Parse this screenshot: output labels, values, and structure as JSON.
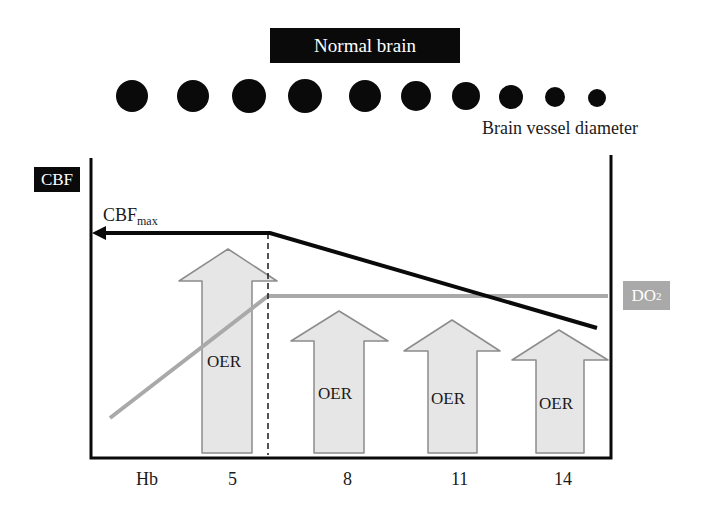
{
  "title": "Normal brain",
  "vessel_label": "Brain vessel diameter",
  "y_axis_label": "CBF",
  "cbfmax_label": {
    "main": "CBF",
    "sub": "max"
  },
  "do2_label": {
    "main": "DO",
    "sub": "2"
  },
  "oer_label": "OER",
  "x_axis": {
    "label": "Hb",
    "ticks": [
      "5",
      "8",
      "11",
      "14"
    ]
  },
  "colors": {
    "black": "#0a0a0a",
    "do2_gray": "#a9a9a9",
    "arrow_fill": "#e6e6e6",
    "arrow_stroke": "#8c8c8c"
  },
  "vessels": [
    {
      "cx": 132,
      "r": 16
    },
    {
      "cx": 193,
      "r": 16
    },
    {
      "cx": 249,
      "r": 17
    },
    {
      "cx": 305,
      "r": 17
    },
    {
      "cx": 365,
      "r": 16
    },
    {
      "cx": 416,
      "r": 15
    },
    {
      "cx": 466,
      "r": 14
    },
    {
      "cx": 511,
      "r": 12
    },
    {
      "cx": 555,
      "r": 10
    },
    {
      "cx": 597,
      "r": 9
    }
  ]
}
